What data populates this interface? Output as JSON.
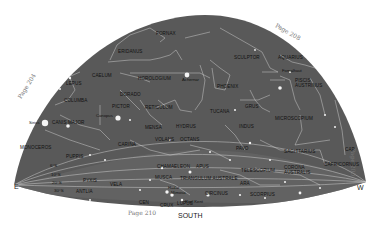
{
  "chart": {
    "colors": {
      "sky": "#5a5a5a",
      "lines": "#d8d8d8",
      "stars": "#f4f4f4",
      "labels": "#111111",
      "page_refs": "#777777"
    }
  },
  "compass": {
    "east": "E",
    "west": "W",
    "south": "SOUTH"
  },
  "page_refs": {
    "left": "Page 204",
    "top_right": "Page 208",
    "right": "Page 200",
    "bottom": "Page 210"
  },
  "latitudes": [
    "6°S",
    "10°S",
    "20°S",
    "30°S"
  ],
  "constellations": {
    "fornax": "FORNAX",
    "eridanus": "ERIDANUS",
    "sculptor": "SCULPTOR",
    "aquarius": "AQUARIUS",
    "piscis_austrinus": "PISCIS AUSTRINUS",
    "lepus": "LEPUS",
    "caelum": "CAELUM",
    "horologium": "HOROLOGIUM",
    "phoenix": "PHOENIX",
    "columba": "COLUMBA",
    "dorado": "DORADO",
    "grus": "GRUS",
    "microscopium": "MICROSCOPIUM",
    "canis_major": "CANIS MAJOR",
    "pictor": "PICTOR",
    "reticulum": "RETICULUM",
    "tucana": "TUCANA",
    "indus": "INDUS",
    "mensa": "MENSA",
    "hydrus": "HYDRUS",
    "monoceros": "MONOCEROS",
    "carina": "CARINA",
    "volans": "VOLANS",
    "octans": "OCTANS",
    "pavo": "PAVO",
    "sagittarius": "SAGITTARIUS",
    "puppis": "PUPPIS",
    "chamaeleon": "CHAMAELEON",
    "apus": "APUS",
    "telescopium": "TELESCOPIUM",
    "corona_australis": "CORONA AUSTRALIS",
    "capricornus": "CAPRICORNUS",
    "pyxis": "PYXIS",
    "vela": "VELA",
    "musca": "MUSCA",
    "triangulum_australe": "TRIANGULUM AUSTRALE",
    "ara": "ARA",
    "antlia": "ANTLIA",
    "circinus": "CIRCINUS",
    "scorpius": "SCORPIUS",
    "centaurus": "CEN",
    "crux": "CRUX",
    "lupus": "LUPUS",
    "capricornus_short": "CAP"
  },
  "stars": {
    "achernar": "Achernar",
    "fomalhaut": "Fomalhaut",
    "canopus": "Canopus",
    "sirius": "Sirius",
    "rigil_kent": "Rigil Kent",
    "hadar": "Hadar",
    "mimosa": "Mimosa"
  }
}
